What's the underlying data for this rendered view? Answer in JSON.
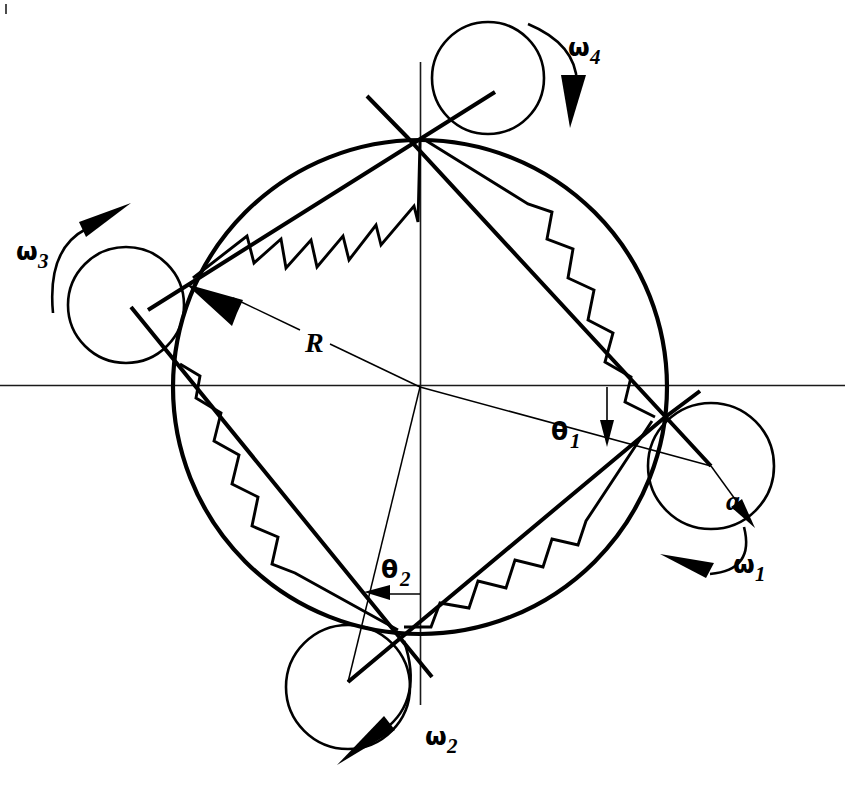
{
  "figure": {
    "background_color": "#ffffff",
    "line_color": "#000000"
  },
  "geometry": {
    "center": {
      "x": 420,
      "y": 387
    },
    "ring_radius": 247,
    "roller_radius_px": 60,
    "axes": {
      "horizontal_y": 385,
      "vertical_x": 420,
      "horizontal_x_start": 0,
      "horizontal_x_end": 845,
      "vertical_y_start": 62,
      "vertical_y_end": 705
    },
    "rollers": [
      {
        "id": "roller-1",
        "label": "omega_1",
        "cx": 711,
        "cy": 466,
        "r": 63,
        "position": "right"
      },
      {
        "id": "roller-2",
        "label": "omega_2",
        "cx": 348,
        "cy": 687,
        "r": 62,
        "position": "bottom"
      },
      {
        "id": "roller-3",
        "label": "omega_3",
        "cx": 126,
        "cy": 305,
        "r": 58,
        "position": "left"
      },
      {
        "id": "roller-4",
        "label": "omega_4",
        "cx": 488,
        "cy": 78,
        "r": 56,
        "position": "top"
      }
    ]
  },
  "labels": {
    "radius": {
      "text": "R",
      "x": 313,
      "y": 350
    },
    "roller_radius": {
      "text": "a",
      "x": 733,
      "y": 501
    },
    "theta1": {
      "glyph": "θ",
      "sub": "1",
      "x": 552,
      "y": 432
    },
    "theta2": {
      "glyph": "θ",
      "sub": "2",
      "x": 384,
      "y": 573
    },
    "omega1": {
      "glyph": "ω",
      "sub": "1",
      "x": 739,
      "y": 565
    },
    "omega2": {
      "glyph": "ω",
      "sub": "2",
      "x": 431,
      "y": 738
    },
    "omega3": {
      "glyph": "ω",
      "sub": "3",
      "x": 22,
      "y": 252
    },
    "omega4": {
      "glyph": "ω",
      "sub": "4",
      "x": 574,
      "y": 48
    }
  },
  "rotation_senses": {
    "omega_1": "counter-clockwise arrow below right roller pointing left",
    "omega_2": "clockwise arrow below bottom roller pointing down-left",
    "omega_3": "clockwise arrow above left roller pointing up-right",
    "omega_4": "clockwise arrow right of top roller pointing down"
  },
  "annotations": {
    "radius_arrow": "arrow from center outward to upper-left contact point labelled R",
    "a_arrow": "arrow from right roller centre to its rim labelled a",
    "theta1_arrow": "vertical down arrow from horizontal axis to inclined radius line",
    "theta2_arrow": "horizontal left arrow from vertical axis to inclined radius line"
  }
}
